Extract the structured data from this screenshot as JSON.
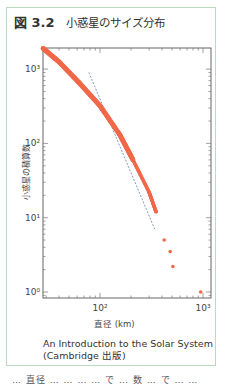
{
  "figure": {
    "number": "図 3.2",
    "title": "小惑星のサイズ分布",
    "caption_line1": "An Introduction to the Solar System",
    "caption_line2": "(Cambridge 出版)",
    "cutoff_text": "… 直径 … … … … で … 数 … で … …"
  },
  "colors": {
    "card_border": "#b9dcc0",
    "data_points": "#f0694a",
    "fit_line": "#6a7fa8",
    "axis": "#555555"
  },
  "chart_data": {
    "type": "scatter",
    "title": "小惑星のサイズ分布",
    "xlabel": "直径 (km)",
    "ylabel": "小惑星の積算数",
    "xscale": "log",
    "yscale": "log",
    "xlim": [
      28,
      1000
    ],
    "ylim": [
      0.8,
      1900
    ],
    "x_ticks": [
      "10²",
      "10³"
    ],
    "y_ticks": [
      "10⁰",
      "10¹",
      "10²",
      "10³"
    ],
    "grid": false,
    "legend": null,
    "series": [
      {
        "name": "asteroids (cumulative count)",
        "style": "dense dots forming a thick curve, orange-red",
        "points": [
          {
            "x": 28,
            "y": 1900
          },
          {
            "x": 40,
            "y": 1250
          },
          {
            "x": 63,
            "y": 650
          },
          {
            "x": 100,
            "y": 320
          },
          {
            "x": 156,
            "y": 130
          },
          {
            "x": 209,
            "y": 60
          },
          {
            "x": 300,
            "y": 22
          },
          {
            "x": 350,
            "y": 12
          },
          {
            "x": 420,
            "y": 5
          },
          {
            "x": 480,
            "y": 3.5
          },
          {
            "x": 510,
            "y": 2.2
          },
          {
            "x": 950,
            "y": 1
          }
        ]
      },
      {
        "name": "power-law fit",
        "style": "dashed blue line",
        "points": [
          {
            "x": 78,
            "y": 900
          },
          {
            "x": 340,
            "y": 7
          }
        ]
      }
    ]
  }
}
